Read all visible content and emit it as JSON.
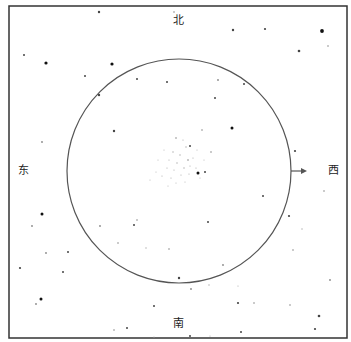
{
  "directions": {
    "north": "北",
    "south": "南",
    "east": "东",
    "west": "西"
  },
  "frame": {
    "x": 9,
    "y": 6,
    "width": 338,
    "height": 332,
    "color": "#333333"
  },
  "field_circle": {
    "cx": 179,
    "cy": 171,
    "r": 112,
    "color": "#555555"
  },
  "arrow": {
    "x1": 291,
    "y1": 171,
    "x2": 307,
    "y2": 171,
    "direction": "west",
    "color": "#555555"
  },
  "stars": [
    [
      99,
      12,
      1.2
    ],
    [
      174,
      12,
      0.8
    ],
    [
      233,
      30,
      1.2
    ],
    [
      265,
      29,
      1.1
    ],
    [
      322,
      31,
      1.9
    ],
    [
      328,
      46,
      0.8
    ],
    [
      299,
      51,
      1.3
    ],
    [
      46,
      63,
      1.6
    ],
    [
      112,
      64,
      1.6
    ],
    [
      24,
      55,
      1.0
    ],
    [
      85,
      76,
      1.0
    ],
    [
      244,
      84,
      1.0
    ],
    [
      218,
      80,
      0.9
    ],
    [
      137,
      79,
      1.0
    ],
    [
      167,
      82,
      1.0
    ],
    [
      99,
      95,
      1.2
    ],
    [
      114,
      131,
      1.2
    ],
    [
      42,
      142,
      0.9
    ],
    [
      215,
      98,
      1.0
    ],
    [
      232,
      128,
      1.5
    ],
    [
      190,
      146,
      1.0
    ],
    [
      202,
      130,
      0.8
    ],
    [
      211,
      152,
      0.8
    ],
    [
      295,
      151,
      1.1
    ],
    [
      198,
      173,
      1.5
    ],
    [
      205,
      172,
      1.0
    ],
    [
      263,
      196,
      1.0
    ],
    [
      208,
      222,
      1.0
    ],
    [
      324,
      191,
      0.8
    ],
    [
      289,
      216,
      1.1
    ],
    [
      293,
      250,
      0.8
    ],
    [
      42,
      214,
      1.5
    ],
    [
      32,
      226,
      0.9
    ],
    [
      46,
      253,
      0.9
    ],
    [
      68,
      252,
      1.0
    ],
    [
      20,
      268,
      1.1
    ],
    [
      134,
      225,
      1.0
    ],
    [
      137,
      220,
      0.8
    ],
    [
      100,
      226,
      0.9
    ],
    [
      63,
      272,
      1.0
    ],
    [
      41,
      299,
      1.5
    ],
    [
      36,
      304,
      0.9
    ],
    [
      154,
      306,
      1.0
    ],
    [
      127,
      328,
      1.0
    ],
    [
      114,
      330,
      0.8
    ],
    [
      179,
      278,
      1.2
    ],
    [
      191,
      289,
      0.9
    ],
    [
      209,
      285,
      0.7
    ],
    [
      169,
      249,
      0.8
    ],
    [
      223,
      265,
      0.9
    ],
    [
      238,
      303,
      1.1
    ],
    [
      254,
      303,
      0.8
    ],
    [
      290,
      305,
      0.8
    ],
    [
      330,
      280,
      0.9
    ],
    [
      319,
      316,
      1.3
    ],
    [
      315,
      329,
      1.1
    ],
    [
      241,
      332,
      1.0
    ],
    [
      190,
      336,
      1.0
    ],
    [
      154,
      337,
      0.6
    ],
    [
      210,
      336,
      0.6
    ],
    [
      146,
      248,
      0.7
    ],
    [
      118,
      243,
      0.8
    ],
    [
      238,
      286,
      0.6
    ],
    [
      302,
      229,
      0.7
    ]
  ],
  "cluster_stars": [
    [
      176,
      138,
      0.8
    ],
    [
      183,
      140,
      0.6
    ],
    [
      186,
      147,
      0.7
    ],
    [
      180,
      155,
      0.7
    ],
    [
      173,
      152,
      0.7
    ],
    [
      169,
      160,
      0.6
    ],
    [
      177,
      163,
      0.7
    ],
    [
      188,
      160,
      0.8
    ],
    [
      193,
      158,
      0.6
    ],
    [
      184,
      168,
      0.7
    ],
    [
      174,
      170,
      0.6
    ],
    [
      167,
      168,
      0.6
    ],
    [
      190,
      166,
      0.6
    ],
    [
      196,
      168,
      0.6
    ],
    [
      162,
      176,
      0.6
    ],
    [
      171,
      178,
      0.6
    ],
    [
      181,
      175,
      0.6
    ],
    [
      189,
      174,
      0.6
    ],
    [
      158,
      160,
      0.5
    ],
    [
      164,
      150,
      0.5
    ],
    [
      197,
      150,
      0.5
    ],
    [
      156,
      172,
      0.5
    ],
    [
      185,
      182,
      0.5
    ],
    [
      176,
      183,
      0.5
    ],
    [
      150,
      180,
      0.5
    ],
    [
      200,
      178,
      0.5
    ],
    [
      168,
      186,
      0.5
    ],
    [
      204,
      160,
      0.5
    ]
  ]
}
